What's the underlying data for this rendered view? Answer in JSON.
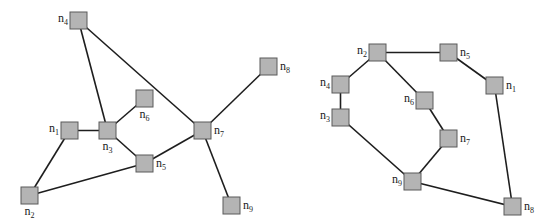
{
  "graphs": [
    {
      "id": "left",
      "nodes": [
        {
          "id": "n1",
          "base": "n",
          "sub": "1",
          "x": 61,
          "y": 122,
          "label_pos": "left"
        },
        {
          "id": "n2",
          "base": "n",
          "sub": "2",
          "x": 21,
          "y": 187,
          "label_pos": "below"
        },
        {
          "id": "n3",
          "base": "n",
          "sub": "3",
          "x": 99,
          "y": 122,
          "label_pos": "below"
        },
        {
          "id": "n4",
          "base": "n",
          "sub": "4",
          "x": 70,
          "y": 12,
          "label_pos": "left"
        },
        {
          "id": "n5",
          "base": "n",
          "sub": "5",
          "x": 136,
          "y": 155,
          "label_pos": "right"
        },
        {
          "id": "n6",
          "base": "n",
          "sub": "6",
          "x": 136,
          "y": 90,
          "label_pos": "below"
        },
        {
          "id": "n7",
          "base": "n",
          "sub": "7",
          "x": 194,
          "y": 122,
          "label_pos": "right"
        },
        {
          "id": "n8",
          "base": "n",
          "sub": "8",
          "x": 260,
          "y": 58,
          "label_pos": "right"
        },
        {
          "id": "n9",
          "base": "n",
          "sub": "9",
          "x": 223,
          "y": 197,
          "label_pos": "right"
        }
      ],
      "edges": [
        [
          "n4",
          "n3"
        ],
        [
          "n4",
          "n7"
        ],
        [
          "n1",
          "n3"
        ],
        [
          "n1",
          "n2"
        ],
        [
          "n3",
          "n6"
        ],
        [
          "n3",
          "n5"
        ],
        [
          "n2",
          "n5"
        ],
        [
          "n5",
          "n7"
        ],
        [
          "n7",
          "n8"
        ],
        [
          "n7",
          "n9"
        ]
      ]
    },
    {
      "id": "right",
      "nodes": [
        {
          "id": "n1",
          "base": "n",
          "sub": "1",
          "x": 486,
          "y": 77,
          "label_pos": "right"
        },
        {
          "id": "n2",
          "base": "n",
          "sub": "2",
          "x": 369,
          "y": 44,
          "label_pos": "left"
        },
        {
          "id": "n3",
          "base": "n",
          "sub": "3",
          "x": 332,
          "y": 109,
          "label_pos": "left"
        },
        {
          "id": "n4",
          "base": "n",
          "sub": "4",
          "x": 332,
          "y": 76,
          "label_pos": "left"
        },
        {
          "id": "n5",
          "base": "n",
          "sub": "5",
          "x": 440,
          "y": 44,
          "label_pos": "right"
        },
        {
          "id": "n6",
          "base": "n",
          "sub": "6",
          "x": 416,
          "y": 92,
          "label_pos": "left"
        },
        {
          "id": "n7",
          "base": "n",
          "sub": "7",
          "x": 440,
          "y": 130,
          "label_pos": "right"
        },
        {
          "id": "n8",
          "base": "n",
          "sub": "8",
          "x": 504,
          "y": 198,
          "label_pos": "right"
        },
        {
          "id": "n9",
          "base": "n",
          "sub": "9",
          "x": 404,
          "y": 173,
          "label_pos": "left"
        }
      ],
      "edges": [
        [
          "n2",
          "n5"
        ],
        [
          "n2",
          "n4"
        ],
        [
          "n2",
          "n6"
        ],
        [
          "n4",
          "n3"
        ],
        [
          "n3",
          "n9"
        ],
        [
          "n6",
          "n7"
        ],
        [
          "n7",
          "n9"
        ],
        [
          "n5",
          "n1"
        ],
        [
          "n1",
          "n8"
        ],
        [
          "n9",
          "n8"
        ]
      ]
    }
  ],
  "style": {
    "node_size": 17,
    "node_fill": "#b4b4b4",
    "node_stroke": "#5a5a5a",
    "edge_color": "#1e1e1e"
  }
}
